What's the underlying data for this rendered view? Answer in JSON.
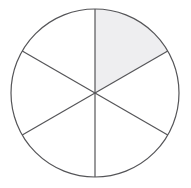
{
  "figure": {
    "name": "fraction-circle-diagram",
    "background_color": "#ffffff"
  },
  "chart_data": {
    "type": "pie",
    "title": "",
    "subtitle": "",
    "xlabel": "",
    "ylabel": "",
    "legend": [],
    "annotations": [],
    "grid": false,
    "total_sectors": 6,
    "shaded_sectors": 1,
    "fraction_shaded": "1/6",
    "sector_angle_degrees": 60,
    "start_angle_degrees": -90,
    "categories": [
      "sector-1",
      "sector-2",
      "sector-3",
      "sector-4",
      "sector-5",
      "sector-6"
    ],
    "values": [
      60,
      60,
      60,
      60,
      60,
      60
    ],
    "slice_fills": [
      "#eeeef0",
      "#ffffff",
      "#ffffff",
      "#ffffff",
      "#ffffff",
      "#ffffff"
    ],
    "slice_states": [
      "shaded",
      "unshaded",
      "unshaded",
      "unshaded",
      "unshaded",
      "unshaded"
    ],
    "slice_start_angles": [
      -90,
      -30,
      30,
      90,
      150,
      210
    ],
    "slice_end_angles": [
      -30,
      30,
      90,
      150,
      210,
      270
    ]
  },
  "geometry": {
    "center_x": 95,
    "center_y": 93,
    "radius": 84,
    "stroke_color": "#555558",
    "stroke_width": 1.2,
    "shaded_fill": "#eeeef0",
    "unshaded_fill": "#ffffff"
  }
}
